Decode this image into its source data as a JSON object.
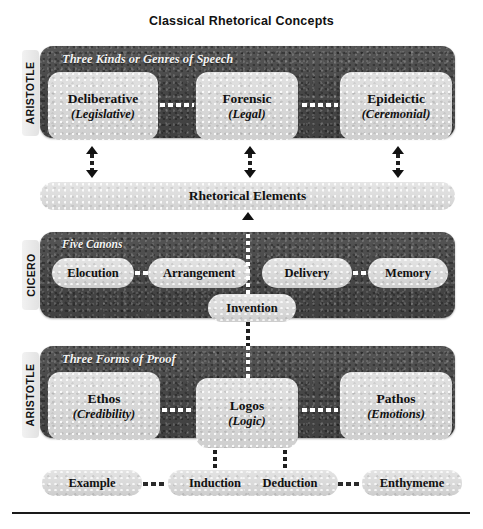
{
  "title": "Classical Rhetorical Concepts",
  "sections": {
    "genres": {
      "author": "ARISTOTLE",
      "heading": "Three Kinds or Genres of Speech",
      "boxes": [
        {
          "main": "Deliberative",
          "sub": "(Legislative)"
        },
        {
          "main": "Forensic",
          "sub": "(Legal)"
        },
        {
          "main": "Epideictic",
          "sub": "(Ceremonial)"
        }
      ]
    },
    "elements": {
      "label": "Rhetorical Elements"
    },
    "canons": {
      "author": "CICERO",
      "heading": "Five Canons",
      "pills": [
        {
          "label": "Elocution"
        },
        {
          "label": "Arrangement"
        },
        {
          "label": "Delivery"
        },
        {
          "label": "Memory"
        }
      ],
      "invention": {
        "label": "Invention"
      }
    },
    "proof": {
      "author": "ARISTOTLE",
      "heading": "Three Forms of Proof",
      "boxes": [
        {
          "main": "Ethos",
          "sub": "(Credibility)"
        },
        {
          "main": "Logos",
          "sub": "(Logic)"
        },
        {
          "main": "Pathos",
          "sub": "(Emotions)"
        }
      ]
    },
    "reasoning": {
      "pills": [
        {
          "label": "Example"
        },
        {
          "label": "Induction"
        },
        {
          "label": "Deduction"
        },
        {
          "label": "Enthymeme"
        }
      ]
    }
  },
  "colors": {
    "panel_dark": "#4c4c4c",
    "box_light": "#d9d9d9",
    "bar_light": "#dedede",
    "text": "#111111",
    "heading_text": "#f4f4f4"
  }
}
